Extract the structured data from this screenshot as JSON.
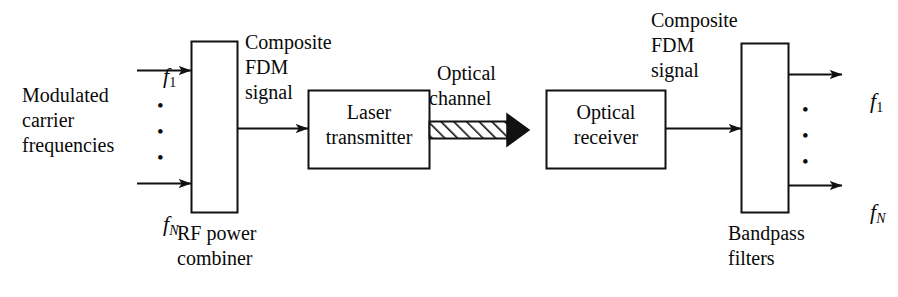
{
  "figure": {
    "type": "block-diagram",
    "width": 898,
    "height": 297,
    "background": "#ffffff",
    "stroke": "#111111"
  },
  "blocks": {
    "rf_combiner": {
      "label": "",
      "caption_line1": "RF power",
      "caption_line2": "combiner",
      "shape": "tall-rectangle"
    },
    "laser_transmitter": {
      "line1": "Laser",
      "line2": "transmitter",
      "shape": "rectangle"
    },
    "optical_receiver": {
      "line1": "Optical",
      "line2": "receiver",
      "shape": "rectangle"
    },
    "bandpass_filters": {
      "label": "",
      "caption_line1": "Bandpass",
      "caption_line2": "filters",
      "shape": "tall-rectangle"
    },
    "optical_channel": {
      "line1": "Optical",
      "line2": "channel",
      "shape": "hatched-arrow",
      "hatch_angle_deg": 45
    }
  },
  "annotations": {
    "inputs_caption": {
      "line1": "Modulated",
      "line2": "carrier",
      "line3": "frequencies"
    },
    "composite_left": {
      "line1": "Composite",
      "line2": "FDM",
      "line3": "signal"
    },
    "composite_right": {
      "line1": "Composite",
      "line2": "FDM",
      "line3": "signal"
    },
    "vertical_dots": "•"
  },
  "signals": {
    "input_first": {
      "symbol": "f",
      "subscript": "1"
    },
    "input_last": {
      "symbol": "f",
      "subscript": "N"
    },
    "output_first": {
      "symbol": "f",
      "subscript": "1"
    },
    "output_last": {
      "symbol": "f",
      "subscript": "N"
    }
  }
}
